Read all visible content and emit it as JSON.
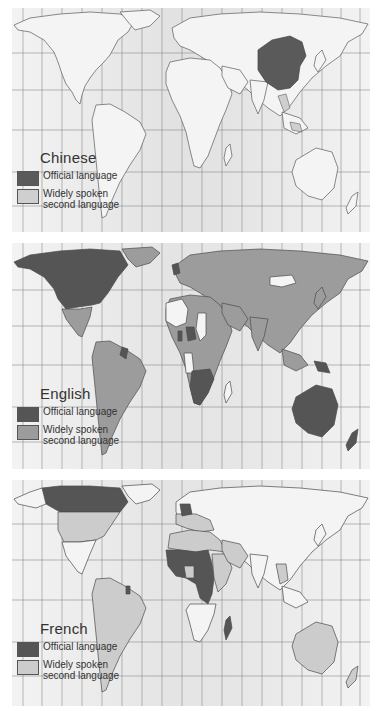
{
  "figure": {
    "panels": [
      {
        "id": "chinese",
        "legend_title": "Chinese",
        "legend": [
          {
            "label": "Official language",
            "color": "#5a5a5a"
          },
          {
            "label": "Widely spoken second language",
            "label_lines": [
              "Widely spoken",
              "second language"
            ],
            "color": "#cfcfcf"
          }
        ],
        "official_regions": [
          "China"
        ],
        "second_language_regions": [
          "Southeast Asia (Thailand, Malaysia, Singapore, Indonesia)"
        ]
      },
      {
        "id": "english",
        "legend_title": "English",
        "legend": [
          {
            "label": "Official language",
            "color": "#555555"
          },
          {
            "label": "Widely spoken second language",
            "label_lines": [
              "Widely spoken",
              "second language"
            ],
            "color": "#9c9c9c"
          }
        ],
        "official_regions": [
          "USA",
          "Canada",
          "UK",
          "Ireland",
          "Australia",
          "New Zealand",
          "South Africa",
          "Southern Africa",
          "Nigeria",
          "Ghana",
          "Guyana",
          "Papua New Guinea"
        ],
        "second_language_regions": [
          "Europe",
          "Russia",
          "Asia",
          "Middle East",
          "Latin America",
          "Much of Africa"
        ]
      },
      {
        "id": "french",
        "legend_title": "French",
        "legend": [
          {
            "label": "Official language",
            "color": "#555555"
          },
          {
            "label": "Widely spoken second language",
            "label_lines": [
              "Widely spoken",
              "second language"
            ],
            "color": "#cccccc"
          }
        ],
        "official_regions": [
          "France",
          "Canada",
          "West Africa",
          "Central Africa",
          "Madagascar",
          "French Guiana"
        ],
        "second_language_regions": [
          "USA",
          "Latin America",
          "North Africa",
          "Middle East",
          "Southern Europe",
          "Australia"
        ]
      }
    ]
  },
  "colors": {
    "ocean": "#efefef",
    "ocean_band": "#e3e3e3",
    "land": "#f4f4f4",
    "outline": "#5a5a5a",
    "grid": "#8a8a8a"
  }
}
